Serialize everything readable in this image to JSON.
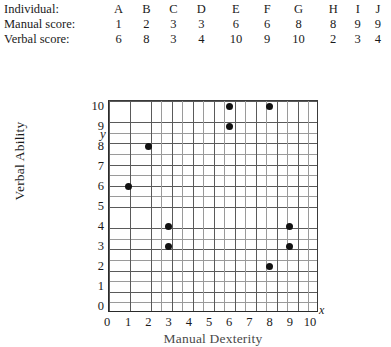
{
  "table": {
    "rows": [
      {
        "label": "Individual:",
        "values": [
          "A",
          "B",
          "C",
          "D",
          "E",
          "F",
          "G",
          "H",
          "I",
          "J"
        ]
      },
      {
        "label": "Manual score:",
        "values": [
          "1",
          "2",
          "3",
          "3",
          "6",
          "6",
          "8",
          "8",
          "9",
          "9"
        ]
      },
      {
        "label": "Verbal score:",
        "values": [
          "6",
          "8",
          "3",
          "4",
          "10",
          "9",
          "10",
          "2",
          "3",
          "4"
        ]
      }
    ]
  },
  "axis_letters": {
    "x": "x",
    "y": "y"
  },
  "chart_data": {
    "type": "scatter",
    "title": "",
    "xlabel": "Manual Dexterity",
    "ylabel": "Verbal Ability",
    "xlim": [
      0,
      10
    ],
    "ylim": [
      0,
      10
    ],
    "xticks": [
      "0",
      "1",
      "2",
      "3",
      "4",
      "5",
      "6",
      "7",
      "8",
      "9",
      "10"
    ],
    "yticks": [
      "0",
      "1",
      "2",
      "3",
      "4",
      "5",
      "6",
      "7",
      "8",
      "9",
      "10"
    ],
    "grid": true,
    "grid_minor": true,
    "legend": null,
    "point_color": "#121212",
    "grid_color": "#5a5a5a",
    "labels": [
      "A",
      "B",
      "C",
      "D",
      "E",
      "F",
      "G",
      "H",
      "I",
      "J"
    ],
    "x": [
      1,
      2,
      3,
      3,
      6,
      6,
      8,
      8,
      9,
      9
    ],
    "y": [
      6,
      8,
      3,
      4,
      10,
      9,
      10,
      2,
      3,
      4
    ],
    "points": [
      {
        "label": "A",
        "x": 1,
        "y": 6
      },
      {
        "label": "B",
        "x": 2,
        "y": 8
      },
      {
        "label": "C",
        "x": 3,
        "y": 3
      },
      {
        "label": "D",
        "x": 3,
        "y": 4
      },
      {
        "label": "E",
        "x": 6,
        "y": 10
      },
      {
        "label": "F",
        "x": 6,
        "y": 9
      },
      {
        "label": "G",
        "x": 8,
        "y": 10
      },
      {
        "label": "H",
        "x": 8,
        "y": 2
      },
      {
        "label": "I",
        "x": 9,
        "y": 3
      },
      {
        "label": "J",
        "x": 9,
        "y": 4
      }
    ]
  }
}
